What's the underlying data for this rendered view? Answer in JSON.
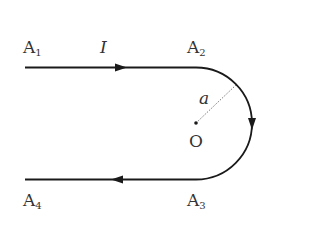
{
  "diagram": {
    "labels": {
      "a1": "A",
      "a1_sub": "1",
      "a2": "A",
      "a2_sub": "2",
      "a3": "A",
      "a3_sub": "3",
      "a4": "A",
      "a4_sub": "4",
      "current": "I",
      "radius": "a",
      "center": "O"
    },
    "colors": {
      "wire": "#1a1a1a",
      "text": "#333333",
      "radius_line": "#555555"
    }
  }
}
